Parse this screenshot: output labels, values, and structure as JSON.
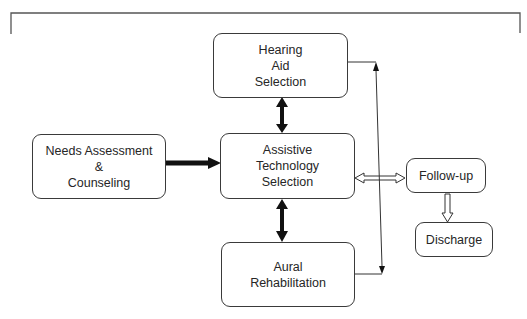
{
  "diagram": {
    "type": "flowchart",
    "nodes": {
      "needs_assessment": {
        "label": "Needs Assessment\n&\nCounseling"
      },
      "hearing_aid": {
        "label": "Hearing\nAid\nSelection"
      },
      "assistive_tech": {
        "label": "Assistive\nTechnology\nSelection"
      },
      "aural_rehab": {
        "label": "Aural\nRehabilitation"
      },
      "follow_up": {
        "label": "Follow-up"
      },
      "discharge": {
        "label": "Discharge"
      }
    },
    "edges": [
      {
        "from": "Needs Assessment & Counseling",
        "to": "Assistive Technology Selection",
        "style": "thick-solid",
        "direction": "forward"
      },
      {
        "from": "Assistive Technology Selection",
        "to": "Hearing Aid Selection",
        "style": "thick-solid",
        "direction": "both"
      },
      {
        "from": "Assistive Technology Selection",
        "to": "Aural Rehabilitation",
        "style": "thick-solid",
        "direction": "both"
      },
      {
        "from": "Assistive Technology Selection",
        "to": "Follow-up",
        "style": "hollow",
        "direction": "both"
      },
      {
        "from": "Follow-up",
        "to": "Discharge",
        "style": "hollow",
        "direction": "forward"
      },
      {
        "from": "Hearing Aid Selection",
        "to": "Aural Rehabilitation",
        "style": "thin-line",
        "direction": "both"
      }
    ],
    "colors": {
      "stroke": "#3a3a3a",
      "arrow_fill": "#111111",
      "bracket": "#555555",
      "background": "#ffffff"
    }
  }
}
